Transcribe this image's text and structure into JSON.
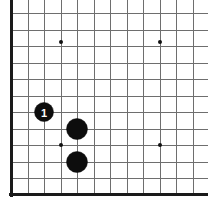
{
  "figure": {
    "background_color": "#ffffff"
  },
  "board": {
    "line_color": "#6e6e6e",
    "edge_color": "#1a1a1a",
    "origin_x": 11,
    "origin_y": 13,
    "cell_size": 16.5,
    "cols": 13,
    "rows": 12,
    "edges": {
      "left": true,
      "bottom": true,
      "top": false,
      "right": false
    },
    "star_points": [
      {
        "name": "star-point-upper-left",
        "x": 61,
        "y": 42
      },
      {
        "name": "star-point-upper-right",
        "x": 160,
        "y": 42
      },
      {
        "name": "star-point-lower-left",
        "x": 61,
        "y": 145
      },
      {
        "name": "star-point-lower-right",
        "x": 160,
        "y": 145
      }
    ],
    "star_radius": 2
  },
  "stones": [
    {
      "name": "stone-1",
      "color": "black",
      "color_hex": "#0d0d0d",
      "label": "1",
      "label_color": "#ffffff",
      "x": 44,
      "y": 112,
      "radius": 9.5
    },
    {
      "name": "stone-2",
      "color": "black",
      "color_hex": "#0d0d0d",
      "label": "",
      "label_color": "#ffffff",
      "x": 77,
      "y": 129,
      "radius": 10.5
    },
    {
      "name": "stone-3",
      "color": "black",
      "color_hex": "#0d0d0d",
      "label": "",
      "label_color": "#ffffff",
      "x": 77,
      "y": 162,
      "radius": 10.5
    }
  ]
}
